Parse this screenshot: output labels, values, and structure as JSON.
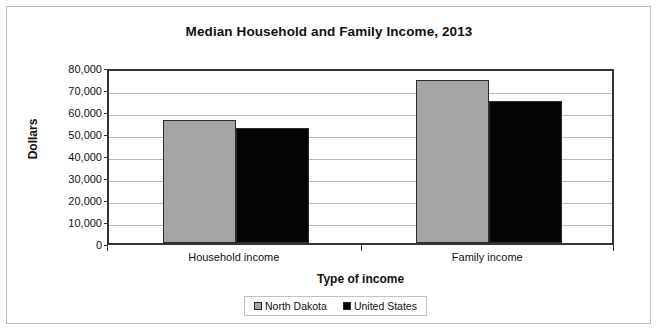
{
  "chart_data": {
    "type": "bar",
    "title": "Median Household and Family Income, 2013",
    "xlabel": "Type of income",
    "ylabel": "Dollars",
    "categories": [
      "Household income",
      "Family income"
    ],
    "series": [
      {
        "name": "North Dakota",
        "color": "#a5a5a5",
        "values": [
          55800,
          74100
        ]
      },
      {
        "name": "United States",
        "color": "#050505",
        "values": [
          52300,
          64600
        ]
      }
    ],
    "ylim": [
      0,
      80000
    ],
    "ytick_values": [
      0,
      10000,
      20000,
      30000,
      40000,
      50000,
      60000,
      70000,
      80000
    ],
    "ytick_labels": [
      "0",
      "10,000",
      "20,000",
      "30,000",
      "40,000",
      "50,000",
      "60,000",
      "70,000",
      "80,000"
    ],
    "grid": "horizontal",
    "legend_position": "bottom"
  },
  "legend": {
    "items": [
      {
        "label": "North Dakota"
      },
      {
        "label": "United States"
      }
    ]
  }
}
